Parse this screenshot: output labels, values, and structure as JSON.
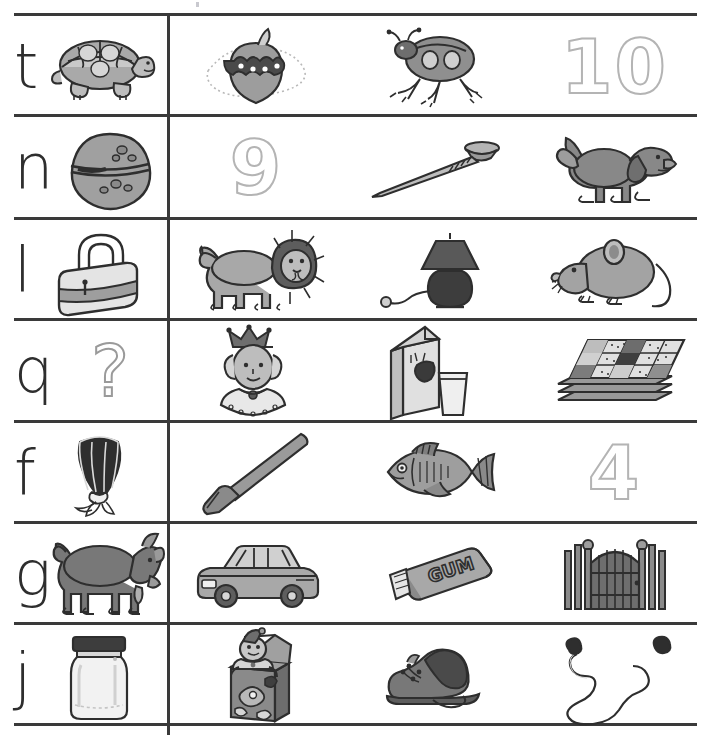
{
  "worksheet": {
    "title": "Beginning Sounds Letter Picture Worksheet",
    "grid": {
      "line_color": "#3a3a3a",
      "outline_color": "#b4b4b4",
      "ink_color": "#2e2e2e",
      "columns": 4,
      "rows": 7
    },
    "rows": [
      {
        "letter": "t",
        "letter_name": "lowercase-t",
        "cells": [
          {
            "icon": "turtle-icon",
            "label": "turtle",
            "kind": "picture"
          },
          {
            "icon": "apple-caterpillar-icon",
            "label": "apple",
            "kind": "picture"
          },
          {
            "icon": "ladybug-icon",
            "label": "ladybug",
            "kind": "picture"
          },
          {
            "icon": "number-ten-outline",
            "label": "10",
            "kind": "outline-number"
          }
        ]
      },
      {
        "letter": "n",
        "letter_name": "lowercase-n",
        "cells": [
          {
            "icon": "nut-icon",
            "label": "nut",
            "kind": "picture"
          },
          {
            "icon": "number-nine-outline",
            "label": "9",
            "kind": "outline-number"
          },
          {
            "icon": "nail-icon",
            "label": "nail",
            "kind": "picture"
          },
          {
            "icon": "dog-icon",
            "label": "dog",
            "kind": "picture"
          }
        ]
      },
      {
        "letter": "l",
        "letter_name": "lowercase-l",
        "cells": [
          {
            "icon": "lock-icon",
            "label": "lock",
            "kind": "picture"
          },
          {
            "icon": "lion-icon",
            "label": "lion",
            "kind": "picture"
          },
          {
            "icon": "lamp-icon",
            "label": "lamp",
            "kind": "picture"
          },
          {
            "icon": "mouse-icon",
            "label": "mouse",
            "kind": "picture"
          }
        ]
      },
      {
        "letter": "q",
        "letter_name": "lowercase-q",
        "cells": [
          {
            "icon": "question-mark-outline",
            "label": "?",
            "kind": "outline-symbol"
          },
          {
            "icon": "queen-icon",
            "label": "queen",
            "kind": "picture"
          },
          {
            "icon": "milk-carton-icon",
            "label": "milk",
            "kind": "picture"
          },
          {
            "icon": "quilt-icon",
            "label": "quilt",
            "kind": "picture"
          }
        ]
      },
      {
        "letter": "f",
        "letter_name": "lowercase-f",
        "cells": [
          {
            "icon": "fan-icon",
            "label": "fan",
            "kind": "picture"
          },
          {
            "icon": "hoe-icon",
            "label": "hoe",
            "kind": "picture"
          },
          {
            "icon": "fish-icon",
            "label": "fish",
            "kind": "picture"
          },
          {
            "icon": "number-four-outline",
            "label": "4",
            "kind": "outline-number"
          }
        ]
      },
      {
        "letter": "g",
        "letter_name": "lowercase-g",
        "cells": [
          {
            "icon": "goat-icon",
            "label": "goat",
            "kind": "picture"
          },
          {
            "icon": "car-icon",
            "label": "car",
            "kind": "picture"
          },
          {
            "icon": "gum-pack-icon",
            "label": "GUM",
            "kind": "picture"
          },
          {
            "icon": "gate-icon",
            "label": "gate",
            "kind": "picture"
          }
        ]
      },
      {
        "letter": "j",
        "letter_name": "lowercase-j",
        "cells": [
          {
            "icon": "jar-icon",
            "label": "jar",
            "kind": "picture"
          },
          {
            "icon": "jack-in-the-box-icon",
            "label": "jack-in-the-box",
            "kind": "picture"
          },
          {
            "icon": "shoe-icon",
            "label": "shoe",
            "kind": "picture"
          },
          {
            "icon": "jump-rope-icon",
            "label": "jump rope",
            "kind": "picture"
          }
        ]
      }
    ]
  }
}
